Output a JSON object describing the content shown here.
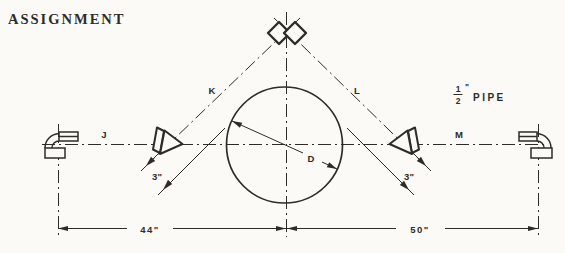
{
  "title": "ASSIGNMENT",
  "pipe_note": {
    "numerator": "1",
    "denominator": "2",
    "inch_mark": "\"",
    "word": "PIPE"
  },
  "labels": {
    "left_run": "J",
    "left_diagonal": "K",
    "right_diagonal": "L",
    "right_run": "M",
    "diameter": "D"
  },
  "dims": {
    "span_left": "44\"",
    "span_right": "50\"",
    "offset_left": "3\"",
    "offset_right": "3\""
  },
  "colors": {
    "ink": "#2e2c28",
    "background": "#fbfaf6"
  }
}
